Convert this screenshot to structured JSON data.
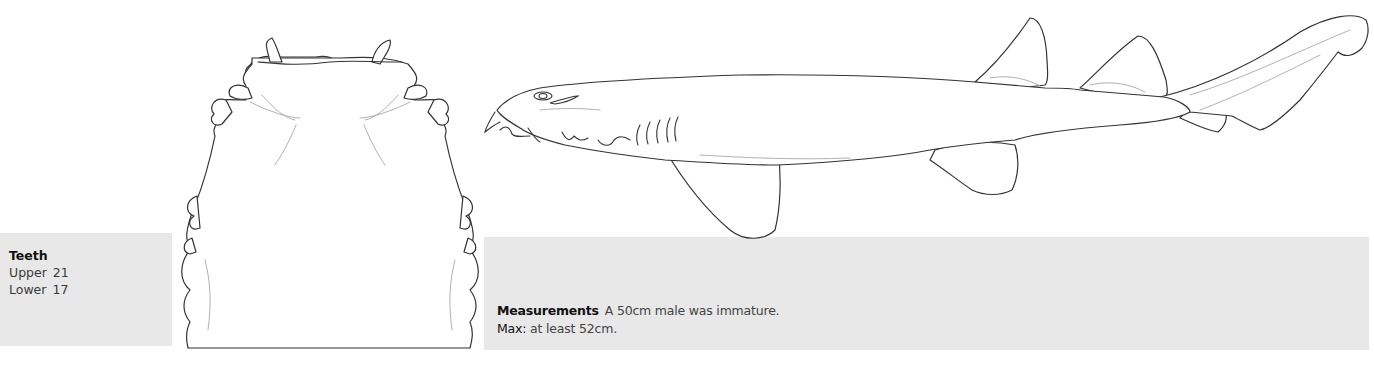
{
  "teeth": {
    "title": "Teeth",
    "rows": [
      {
        "label": "Upper",
        "value": "21"
      },
      {
        "label": "Lower",
        "value": "17"
      }
    ]
  },
  "measurements": {
    "label": "Measurements",
    "text": "A 50cm male was immature.",
    "max_label": "Max:",
    "max_text": "at least 52cm."
  },
  "illustrations": {
    "head_view": "shark-head-ventral-view",
    "body_view": "shark-lateral-view"
  },
  "colors": {
    "panel_bg": "#e8e8e8",
    "line": "#333333"
  }
}
